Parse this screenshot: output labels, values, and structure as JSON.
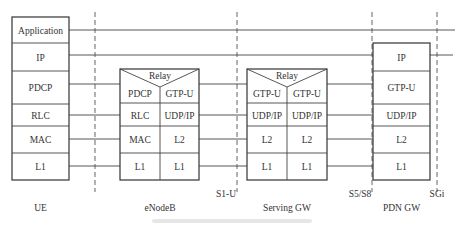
{
  "diagram": {
    "nodes": [
      {
        "id": "ue",
        "label": "UE",
        "layers": [
          "Application",
          "IP",
          "PDCP",
          "RLC",
          "MAC",
          "L1"
        ]
      },
      {
        "id": "enodeb",
        "label": "eNodeB",
        "relay_label": "Relay",
        "left_layers": [
          "PDCP",
          "RLC",
          "MAC",
          "L1"
        ],
        "right_layers": [
          "GTP-U",
          "UDP/IP",
          "L2",
          "L1"
        ]
      },
      {
        "id": "serving-gw",
        "label": "Serving GW",
        "relay_label": "Relay",
        "left_layers": [
          "GTP-U",
          "UDP/IP",
          "L2",
          "L1"
        ],
        "right_layers": [
          "GTP-U",
          "UDP/IP",
          "L2",
          "L1"
        ]
      },
      {
        "id": "pdn-gw",
        "label": "PDN GW",
        "layers": [
          "IP",
          "GTP-U",
          "UDP/IP",
          "L2",
          "L1"
        ]
      }
    ],
    "interfaces": [
      "S1-U",
      "S5/S8",
      "SGi"
    ],
    "colors": {
      "stroke": "#333333",
      "text": "#333333",
      "background": "#ffffff"
    }
  }
}
